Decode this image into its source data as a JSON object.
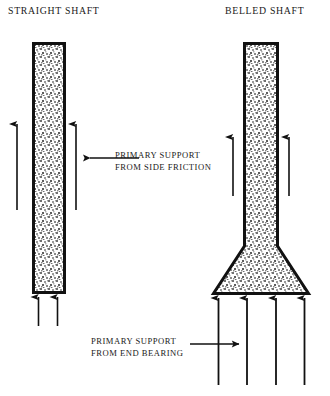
{
  "figure": {
    "type": "technical-diagram",
    "background_color": "#ffffff",
    "line_color": "#111111",
    "concrete_fill": "#d8d8d8"
  },
  "titles": {
    "left": "STRAIGHT SHAFT",
    "right": "BELLED SHAFT"
  },
  "annotations": {
    "side_friction": {
      "line1": "PRIMARY SUPPORT",
      "line2": "FROM SIDE FRICTION",
      "arrow_direction": "left"
    },
    "end_bearing": {
      "line1": "PRIMARY SUPPORT",
      "line2": "FROM END BEARING",
      "arrow_direction": "right"
    }
  },
  "shafts": {
    "straight": {
      "name": "straight-shaft",
      "x": 32,
      "y": 42,
      "width": 34,
      "height": 252,
      "border_width": 3,
      "friction_arrows": 2,
      "bearing_arrows": 2
    },
    "belled": {
      "name": "belled-shaft",
      "x": 243,
      "y": 42,
      "width": 36,
      "shaft_bottom_y": 245,
      "bell_base_y": 295,
      "bell_left_x": 212,
      "bell_right_x": 310,
      "border_width": 3,
      "friction_arrows": 2,
      "bearing_arrows": 4
    }
  }
}
